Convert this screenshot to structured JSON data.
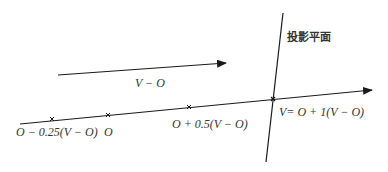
{
  "diagram": {
    "title": "",
    "plane_label": "投影平面",
    "vector_label": "V − O",
    "points": [
      {
        "label": "O − 0.25(V − O)",
        "t": -0.25
      },
      {
        "label": "O",
        "t": 0
      },
      {
        "label": "O + 0.5(V − O)",
        "t": 0.5
      },
      {
        "label": "V= O + 1(V − O)",
        "t": 1
      }
    ],
    "colors": {
      "stroke": "#1a1a1a",
      "text": "#333333",
      "background": "#ffffff"
    }
  }
}
